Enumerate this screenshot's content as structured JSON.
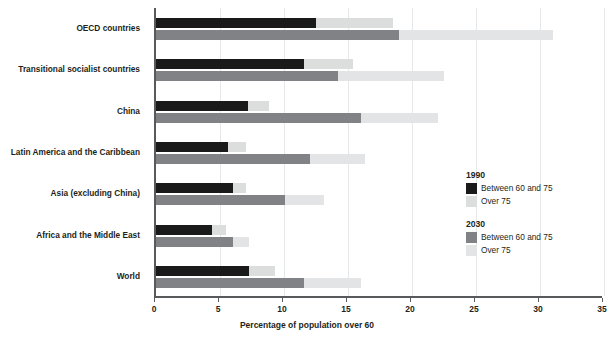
{
  "chart_data": {
    "type": "bar",
    "orientation": "horizontal",
    "title": "",
    "xlabel": "Percentage of population over 60",
    "ylabel": "",
    "xlim": [
      0,
      35
    ],
    "xticks": [
      0,
      5,
      10,
      15,
      20,
      25,
      30,
      35
    ],
    "xtick_labels": [
      "0",
      "5",
      "10",
      "15",
      "20",
      "25",
      "30",
      "35"
    ],
    "grid": true,
    "legend_position": "center-right",
    "categories": [
      "OECD countries",
      "Transitional socialist countries",
      "China",
      "Latin America and the Caribbean",
      "Asia (excluding China)",
      "Africa and the Middle East",
      "World"
    ],
    "series": [
      {
        "name": "1990 Between 60 and 75",
        "group": "1990",
        "segment": "Between 60 and 75",
        "color": "#1a1a1a",
        "values": [
          12.5,
          11.6,
          7.2,
          5.6,
          6.0,
          4.4,
          7.3
        ]
      },
      {
        "name": "1990 Over 75",
        "group": "1990",
        "segment": "Over 75",
        "color": "#dcdddd",
        "values": [
          6.0,
          3.8,
          1.6,
          1.4,
          1.0,
          1.1,
          2.0
        ]
      },
      {
        "name": "2030 Between 60 and 75",
        "group": "2030",
        "segment": "Between 60 and 75",
        "color": "#808285",
        "values": [
          19.0,
          14.2,
          16.0,
          12.0,
          10.1,
          6.0,
          11.6
        ]
      },
      {
        "name": "2030 Over 75",
        "group": "2030",
        "segment": "Over 75",
        "color": "#e3e4e5",
        "values": [
          12.0,
          8.3,
          6.0,
          4.3,
          3.0,
          1.3,
          4.4
        ]
      }
    ],
    "totals_1990": [
      18.5,
      15.4,
      8.8,
      7.0,
      7.0,
      5.5,
      9.3
    ],
    "totals_2030": [
      31.0,
      22.5,
      22.0,
      16.3,
      13.1,
      7.3,
      16.0
    ]
  },
  "axis": {
    "x_title": "Percentage of population over 60"
  },
  "legend": {
    "blocks": [
      {
        "title": "1990",
        "entries": [
          {
            "label": "Between 60 and 75",
            "color": "#1a1a1a"
          },
          {
            "label": "Over 75",
            "color": "#dcdddd"
          }
        ]
      },
      {
        "title": "2030",
        "entries": [
          {
            "label": "Between 60 and 75",
            "color": "#808285"
          },
          {
            "label": "Over 75",
            "color": "#e3e4e5"
          }
        ]
      }
    ]
  }
}
